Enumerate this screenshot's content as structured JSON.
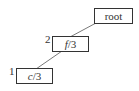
{
  "diagram": {
    "type": "tree",
    "nodes": [
      {
        "id": "root",
        "label": "root",
        "index": ""
      },
      {
        "id": "f3",
        "label_var": "f",
        "label_rest": "/3",
        "index": "2"
      },
      {
        "id": "c3",
        "label_var": "c",
        "label_rest": "/3",
        "index": "1"
      }
    ],
    "edges": [
      {
        "from": "root",
        "to": "f3"
      },
      {
        "from": "f3",
        "to": "c3"
      }
    ],
    "colors": {
      "stroke": "#333333",
      "background": "#ffffff"
    }
  }
}
